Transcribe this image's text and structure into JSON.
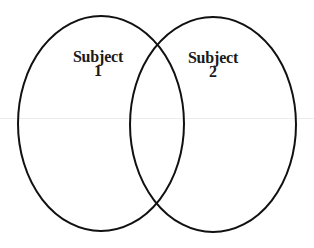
{
  "diagram": {
    "type": "venn",
    "stroke_color": "#111111",
    "background_color": "#ffffff",
    "circles": [
      {
        "id": "subject-1",
        "title": "Subject",
        "number": "1",
        "cx": 101,
        "cy": 123.5,
        "rx": 83,
        "ry": 107.5
      },
      {
        "id": "subject-2",
        "title": "Subject",
        "number": "2",
        "cx": 213,
        "cy": 124.5,
        "rx": 83,
        "ry": 107.5
      }
    ]
  }
}
